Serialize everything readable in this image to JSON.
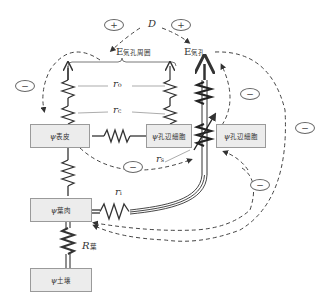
{
  "nodes": {
    "epidermis": {
      "symbol": "ψ",
      "sub": "表皮"
    },
    "guard_cell_left": {
      "symbol": "ψ",
      "sub": "孔辺細胞"
    },
    "guard_cell_right": {
      "symbol": "ψ",
      "sub": "孔辺細胞"
    },
    "mesophyll": {
      "symbol": "ψ",
      "sub": "葉肉"
    },
    "soil": {
      "symbol": "ψ",
      "sub": "土壌"
    }
  },
  "labels": {
    "D": "D",
    "E_surround": {
      "main": "E",
      "sub": "気孔周囲"
    },
    "E_stomata": {
      "main": "E",
      "sub": "気孔"
    },
    "r_o": {
      "main": "r",
      "sub": "o"
    },
    "r_c": {
      "main": "r",
      "sub": "c"
    },
    "r_s": {
      "main": "r",
      "sub": "s"
    },
    "r_i": {
      "main": "r",
      "sub": "i"
    },
    "R_leaf": {
      "main": "R",
      "sub": "葉"
    }
  },
  "signs": [
    {
      "id": "plus-left",
      "text": "+"
    },
    {
      "id": "plus-right",
      "text": "+"
    },
    {
      "id": "minus-far-left",
      "text": "−"
    },
    {
      "id": "minus-center",
      "text": "−"
    },
    {
      "id": "minus-upper-right",
      "text": "−"
    },
    {
      "id": "minus-right",
      "text": "−"
    },
    {
      "id": "minus-lower-right",
      "text": "−"
    }
  ],
  "colors": {
    "line": "#333333",
    "dash": "#444444",
    "box_fill": "#ececec",
    "box_border": "#9a9a9a"
  }
}
